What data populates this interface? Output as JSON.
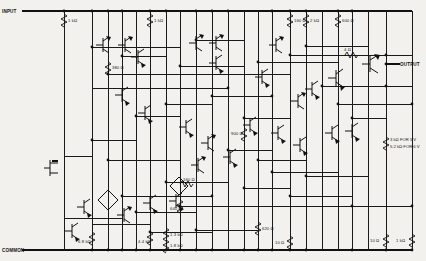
{
  "diagram": {
    "kind": "transistor-schematic",
    "title": "",
    "background_color": "#f2f1ee",
    "ink_color": "#1a1a1a"
  },
  "terminals": [
    {
      "id": "input",
      "label": "INPUT",
      "position": "top-left"
    },
    {
      "id": "output",
      "label": "OUTPUT",
      "position": "right"
    },
    {
      "id": "common",
      "label": "COMMON",
      "position": "bottom-left"
    }
  ],
  "notes": [
    {
      "id": "supply-note-line1",
      "text": "3 kΩ FOR 5 V"
    },
    {
      "id": "supply-note-line2",
      "text": "5.2 kΩ FOR 6 V"
    }
  ],
  "resistors": [
    {
      "id": "r-top-1k-a",
      "value": "1 kΩ",
      "x": 64,
      "y": 20
    },
    {
      "id": "r-top-1k-b",
      "value": "1 kΩ",
      "x": 150,
      "y": 20
    },
    {
      "id": "r-mid-380",
      "value": "380 Ω",
      "x": 114,
      "y": 67
    },
    {
      "id": "r-top-160",
      "value": "160 Ω",
      "x": 293,
      "y": 20
    },
    {
      "id": "r-top-2k",
      "value": "2 kΩ",
      "x": 317,
      "y": 20
    },
    {
      "id": "r-top-600",
      "value": "600 Ω",
      "x": 352,
      "y": 20
    },
    {
      "id": "r-out-4",
      "value": "4 Ω",
      "x": 352,
      "y": 54
    },
    {
      "id": "r-mid-900",
      "value": "900 Ω",
      "x": 237,
      "y": 133
    },
    {
      "id": "r-mid-160",
      "value": "160 Ω",
      "x": 186,
      "y": 184
    },
    {
      "id": "r-mid-640",
      "value": "640 Ω",
      "x": 180,
      "y": 208
    },
    {
      "id": "r-bot-6k8",
      "value": "6.8 kΩ",
      "x": 82,
      "y": 241
    },
    {
      "id": "r-bot-4k4",
      "value": "4.4 kΩ",
      "x": 145,
      "y": 241
    },
    {
      "id": "r-bot-1k3",
      "value": "1.3 kΩ",
      "x": 177,
      "y": 234
    },
    {
      "id": "r-bot-1k8",
      "value": "1.8 kΩ",
      "x": 177,
      "y": 243
    },
    {
      "id": "r-bot-620",
      "value": "620 Ω",
      "x": 263,
      "y": 228
    },
    {
      "id": "r-bot-10-a",
      "value": "10 Ω",
      "x": 277,
      "y": 242
    },
    {
      "id": "r-bot-10-b",
      "value": "10 Ω",
      "x": 350,
      "y": 240
    },
    {
      "id": "r-bot-1k",
      "value": "1 kΩ",
      "x": 378,
      "y": 240
    }
  ],
  "rails": [
    {
      "id": "top-rail",
      "label": "INPUT"
    },
    {
      "id": "bottom-rail",
      "label": "COMMON"
    }
  ]
}
